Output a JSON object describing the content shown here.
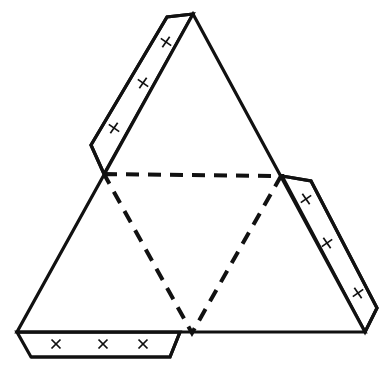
{
  "figure": {
    "canvas": {
      "width": 388,
      "height": 379
    },
    "colors": {
      "background": "#ffffff",
      "stroke": "#111111",
      "face_fill": "#ffffff",
      "tab_fill": "#ffffff"
    },
    "stroke_widths": {
      "solid_edge": 3.2,
      "fold_line": 4.0,
      "x_mark": 1.7
    },
    "dash_pattern": "13 9"
  },
  "main_triangle": {
    "name": "outer-triangle",
    "points": "193,14 365,332 17,332",
    "vertices": [
      {
        "label": "apex",
        "x": 193,
        "y": 14
      },
      {
        "label": "bottom-right",
        "x": 365,
        "y": 332
      },
      {
        "label": "bottom-left",
        "x": 17,
        "y": 332
      }
    ]
  },
  "fold_lines": {
    "name": "inner-dashed-triangle",
    "points": "104,174 281,176 192,333 104,174",
    "midpoints": [
      {
        "label": "left-midpoint",
        "x": 104,
        "y": 174
      },
      {
        "label": "right-midpoint",
        "x": 281,
        "y": 176
      },
      {
        "label": "bottom-midpoint",
        "x": 192,
        "y": 333
      }
    ],
    "segments": [
      {
        "name": "top-fold",
        "from": [
          104,
          174
        ],
        "to": [
          281,
          176
        ]
      },
      {
        "name": "left-fold",
        "from": [
          104,
          174
        ],
        "to": [
          192,
          333
        ]
      },
      {
        "name": "right-fold",
        "from": [
          281,
          176
        ],
        "to": [
          192,
          333
        ]
      }
    ]
  },
  "tabs": [
    {
      "name": "left-tab",
      "attached_edge": "upper-left",
      "points": "193,14 167,17 91,145 104,174",
      "x_marks": [
        {
          "cx": 166,
          "cy": 42
        },
        {
          "cx": 143,
          "cy": 83
        },
        {
          "cx": 114,
          "cy": 128
        }
      ],
      "x_mark_size": 9,
      "x_mark_rotation": -10
    },
    {
      "name": "right-tab",
      "attached_edge": "lower-right",
      "points": "282,176 311,181 377,308 365,332",
      "x_marks": [
        {
          "cx": 306,
          "cy": 199
        },
        {
          "cx": 327,
          "cy": 243
        },
        {
          "cx": 358,
          "cy": 293
        }
      ],
      "x_mark_size": 9,
      "x_mark_rotation": 10
    },
    {
      "name": "bottom-tab",
      "attached_edge": "bottom",
      "points": "17,332 180,332 170,357 31,357",
      "x_marks": [
        {
          "cx": 56,
          "cy": 344
        },
        {
          "cx": 103,
          "cy": 344
        },
        {
          "cx": 143,
          "cy": 344
        }
      ],
      "x_mark_size": 9,
      "x_mark_rotation": 0
    }
  ],
  "x_mark_count_total": 9
}
